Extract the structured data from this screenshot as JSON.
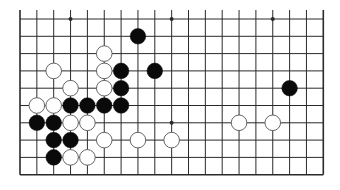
{
  "game": "Go",
  "board": {
    "size": 19,
    "visible_columns": 19,
    "visible_rows": 10,
    "edges": {
      "left": true,
      "right": true,
      "bottom": true,
      "top": false
    },
    "colors": {
      "background": "#ffffff",
      "line": "#2a2a2a",
      "black_stone": "#0a0a0a",
      "white_stone": "#ffffff",
      "white_stone_border": "#555555"
    },
    "star_points": [
      {
        "col": 3,
        "row": 0
      },
      {
        "col": 9,
        "row": 0
      },
      {
        "col": 15,
        "row": 0
      },
      {
        "col": 3,
        "row": 6
      },
      {
        "col": 9,
        "row": 6
      },
      {
        "col": 15,
        "row": 6
      }
    ]
  },
  "stones": [
    {
      "color": "black",
      "col": 7,
      "row": 1
    },
    {
      "color": "white",
      "col": 5,
      "row": 2
    },
    {
      "color": "white",
      "col": 2,
      "row": 3
    },
    {
      "color": "white",
      "col": 5,
      "row": 3
    },
    {
      "color": "black",
      "col": 6,
      "row": 3
    },
    {
      "color": "black",
      "col": 8,
      "row": 3
    },
    {
      "color": "white",
      "col": 3,
      "row": 4
    },
    {
      "color": "white",
      "col": 5,
      "row": 4
    },
    {
      "color": "black",
      "col": 6,
      "row": 4
    },
    {
      "color": "black",
      "col": 16,
      "row": 4
    },
    {
      "color": "white",
      "col": 1,
      "row": 5
    },
    {
      "color": "white",
      "col": 2,
      "row": 5
    },
    {
      "color": "black",
      "col": 3,
      "row": 5
    },
    {
      "color": "black",
      "col": 4,
      "row": 5
    },
    {
      "color": "black",
      "col": 5,
      "row": 5
    },
    {
      "color": "black",
      "col": 6,
      "row": 5
    },
    {
      "color": "black",
      "col": 1,
      "row": 6
    },
    {
      "color": "black",
      "col": 2,
      "row": 6
    },
    {
      "color": "white",
      "col": 3,
      "row": 6
    },
    {
      "color": "white",
      "col": 4,
      "row": 6
    },
    {
      "color": "white",
      "col": 13,
      "row": 6
    },
    {
      "color": "white",
      "col": 15,
      "row": 6
    },
    {
      "color": "black",
      "col": 2,
      "row": 7
    },
    {
      "color": "black",
      "col": 3,
      "row": 7
    },
    {
      "color": "white",
      "col": 5,
      "row": 7
    },
    {
      "color": "white",
      "col": 7,
      "row": 7
    },
    {
      "color": "white",
      "col": 9,
      "row": 7
    },
    {
      "color": "black",
      "col": 2,
      "row": 8
    },
    {
      "color": "white",
      "col": 3,
      "row": 8
    },
    {
      "color": "white",
      "col": 4,
      "row": 8
    }
  ]
}
